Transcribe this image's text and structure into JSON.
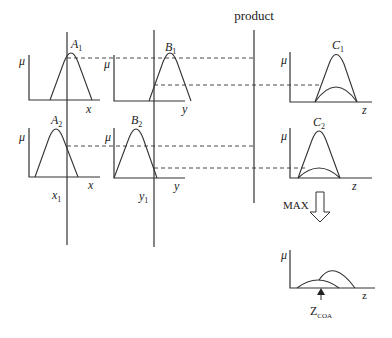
{
  "title": "product",
  "labels": {
    "mu": "μ",
    "x": "x",
    "y": "y",
    "z": "z",
    "A1": "A",
    "A1_sub": "1",
    "B1": "B",
    "B1_sub": "1",
    "C1": "C",
    "C1_sub": "1",
    "A2": "A",
    "A2_sub": "2",
    "B2": "B",
    "B2_sub": "2",
    "C2": "C",
    "C2_sub": "2",
    "x1": "x",
    "x1_sub": "1",
    "y1": "y",
    "y1_sub": "1",
    "max": "MAX",
    "zcoa": "Z",
    "zcoa_sub": "COA"
  },
  "graphs": [
    {
      "id": "A1",
      "row": 1,
      "axis": "x"
    },
    {
      "id": "B1",
      "row": 1,
      "axis": "y"
    },
    {
      "id": "C1",
      "row": 1,
      "axis": "z"
    },
    {
      "id": "A2",
      "row": 2,
      "axis": "x"
    },
    {
      "id": "B2",
      "row": 2,
      "axis": "y"
    },
    {
      "id": "C2",
      "row": 2,
      "axis": "z"
    },
    {
      "id": "aggregate",
      "row": 3,
      "axis": "z"
    }
  ],
  "icons": {
    "down_arrow": "hollow-down-arrow",
    "up_arrow": "solid-up-arrow"
  }
}
